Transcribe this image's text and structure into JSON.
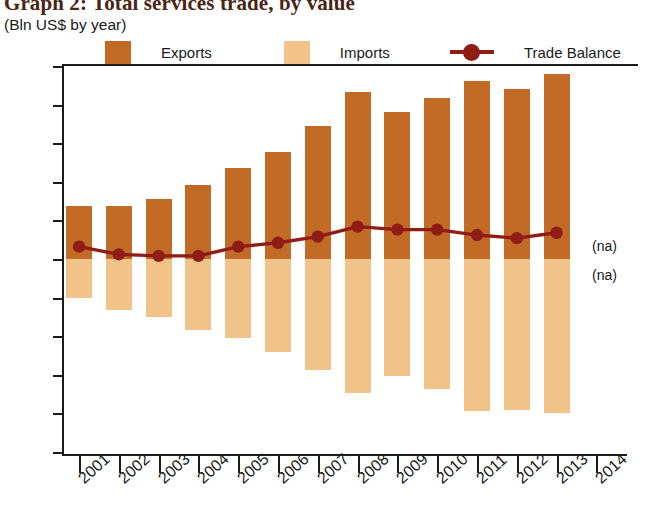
{
  "title": {
    "main": "Graph 2: Total services trade, by value",
    "sub": "(Bln US$ by year)"
  },
  "legend": {
    "items": [
      {
        "label": "Exports",
        "color": "#C26B26",
        "marker": "square"
      },
      {
        "label": "Imports",
        "color": "#F2C389",
        "marker": "square"
      },
      {
        "label": "Trade Balance",
        "color": "#8F1D16",
        "marker": "line-dot"
      }
    ]
  },
  "annotations": {
    "na_above": "(na)",
    "na_below": "(na)"
  },
  "chart_data": {
    "type": "bar",
    "title": "Graph 2: Total services trade, by value",
    "subtitle": "(Bln US$ by year)",
    "xlabel": "",
    "ylabel": "",
    "ylim": [
      -25,
      25
    ],
    "yticks": [
      25,
      20,
      15,
      10,
      5,
      0,
      -5,
      -10,
      -15,
      -20,
      -25
    ],
    "ytick_labels": [
      "25",
      "20",
      "15",
      "10",
      "5",
      "0",
      "-5",
      "-10",
      "-15",
      "-20",
      "-25"
    ],
    "grid": false,
    "legend_position": "top",
    "categories": [
      "2001",
      "2002",
      "2003",
      "2004",
      "2005",
      "2006",
      "2007",
      "2008",
      "2009",
      "2010",
      "2011",
      "2012",
      "2013",
      "2014"
    ],
    "xtick_labels": [
      "2001",
      "2002",
      "2003",
      "2004",
      "2005",
      "2006",
      "2007",
      "2008",
      "2009",
      "2010",
      "2011",
      "2012",
      "2013",
      "2014"
    ],
    "series": [
      {
        "name": "Exports",
        "type": "bar",
        "color": "#C26B26",
        "values": [
          6.9,
          6.9,
          7.8,
          9.6,
          11.8,
          13.9,
          17.2,
          21.6,
          19.1,
          20.8,
          23.1,
          22.0,
          23.9,
          null
        ]
      },
      {
        "name": "Imports",
        "type": "bar",
        "color": "#F2C389",
        "values": [
          -5.1,
          -6.6,
          -7.5,
          -9.2,
          -10.2,
          -12.0,
          -14.4,
          -17.3,
          -15.2,
          -16.9,
          -19.7,
          -19.6,
          -19.9,
          null
        ]
      },
      {
        "name": "Trade Balance",
        "type": "line",
        "color": "#8F1D16",
        "values": [
          1.6,
          0.6,
          0.4,
          0.4,
          1.6,
          2.1,
          2.9,
          4.2,
          3.8,
          3.8,
          3.1,
          2.7,
          3.4,
          null
        ]
      }
    ]
  }
}
